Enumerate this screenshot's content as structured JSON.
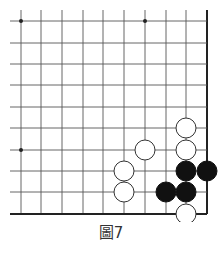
{
  "diagram": {
    "type": "go-board-corner",
    "caption": "圖7",
    "grid": {
      "columns_x": [
        21,
        41,
        62,
        83,
        103,
        124,
        145,
        166,
        186,
        207
      ],
      "rows_y": [
        21,
        43,
        64,
        85,
        107,
        128,
        150,
        171,
        192,
        214
      ],
      "open_edge_left_x": 10,
      "open_edge_top_y": 10,
      "right_edge": "board-edge",
      "bottom_edge": "board-edge"
    },
    "star_points": [
      {
        "col": 0,
        "row": 0
      },
      {
        "col": 6,
        "row": 0
      },
      {
        "col": 0,
        "row": 6
      }
    ],
    "stones": [
      {
        "color": "white",
        "col": 8,
        "row": 5
      },
      {
        "color": "white",
        "col": 8,
        "row": 6
      },
      {
        "color": "white",
        "col": 6,
        "row": 6
      },
      {
        "color": "white",
        "col": 5,
        "row": 7
      },
      {
        "color": "white",
        "col": 5,
        "row": 8
      },
      {
        "color": "white",
        "col": 8,
        "row": 9
      },
      {
        "color": "black",
        "col": 8,
        "row": 7
      },
      {
        "color": "black",
        "col": 9,
        "row": 7
      },
      {
        "color": "black",
        "col": 7,
        "row": 8
      },
      {
        "color": "black",
        "col": 8,
        "row": 8
      }
    ],
    "colors": {
      "line": "#555555",
      "edge": "#222222",
      "black_stone": "#111111",
      "white_stone": "#ffffff",
      "stone_outline": "#333333"
    }
  }
}
